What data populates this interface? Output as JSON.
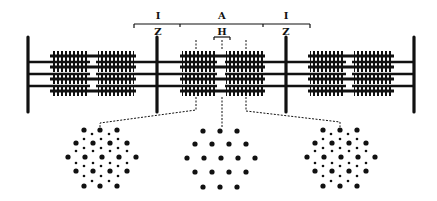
{
  "diagram": {
    "type": "sarcomere-schematic",
    "labels": {
      "left_i_band": "I",
      "a_band": "A",
      "right_i_band": "I",
      "left_z_line": "Z",
      "h_zone": "H",
      "right_z_line": "Z"
    },
    "colors": {
      "ink": "#111111",
      "background": "#ffffff"
    },
    "z_lines_x": [
      28,
      157,
      286,
      414
    ],
    "thin_filament_rows_y": [
      62,
      74,
      86
    ],
    "thick_filament_rows_y": [
      56,
      67,
      79,
      91
    ],
    "thick_filament_groups": [
      {
        "x_start": 52,
        "x_end": 134,
        "h_gap": [
          88,
          98
        ]
      },
      {
        "x_start": 182,
        "x_end": 263,
        "h_gap": [
          216,
          226
        ]
      },
      {
        "x_start": 310,
        "x_end": 392,
        "h_gap": [
          344,
          354
        ]
      }
    ],
    "cross_sections": [
      {
        "name": "overlap-region-left",
        "center_x": 102,
        "center_y": 158,
        "pattern": "thick+thin"
      },
      {
        "name": "h-zone",
        "center_x": 220,
        "center_y": 158,
        "pattern": "thick-only"
      },
      {
        "name": "overlap-region-right",
        "center_x": 340,
        "center_y": 158,
        "pattern": "thick+thin"
      }
    ]
  }
}
